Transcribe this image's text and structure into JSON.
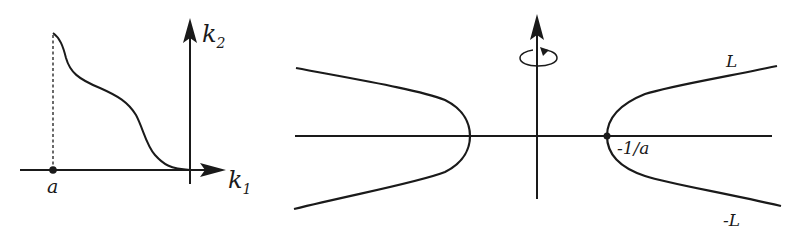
{
  "figure": {
    "left_panel": {
      "x_axis_label": "k",
      "x_axis_subscript": "1",
      "y_axis_label": "k",
      "y_axis_subscript": "2",
      "point_label": "a",
      "description": "Decreasing curve starting above point a on the k1 axis, tangentially approaching the k1 axis at the origin"
    },
    "right_panel": {
      "vertex_label": "-1/a",
      "upper_asymptote_label": "L",
      "lower_asymptote_label": "-L",
      "rotation_symbol": "rotation-about-vertical-axis",
      "description": "Two hyperbola-like branches symmetric about the vertical axis; rotation indicated about the vertical axis"
    },
    "colors": {
      "line": "#1a1a1a",
      "background": "#ffffff"
    }
  }
}
